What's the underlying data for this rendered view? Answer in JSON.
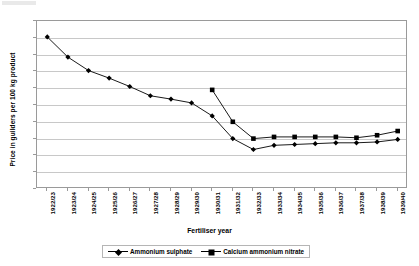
{
  "chart_data": {
    "type": "line",
    "title": "",
    "xlabel": "Fertiliser year",
    "ylabel": "Price in guilders per 100 kg product",
    "ylim": [
      0,
      20
    ],
    "ytick_step": 2,
    "yticks": [
      0,
      2,
      4,
      6,
      8,
      10,
      12,
      14,
      16,
      18,
      20
    ],
    "grid": true,
    "legend_position": "bottom",
    "categories": [
      "1922/23",
      "1923/24",
      "1924/25",
      "1925/26",
      "1926/27",
      "1927/28",
      "1928/29",
      "1929/30",
      "1930/31",
      "1931/32",
      "1932/33",
      "1933/34",
      "1934/35",
      "1935/36",
      "1936/37",
      "1937/38",
      "1938/39",
      "1939/40"
    ],
    "series": [
      {
        "name": "Ammonium sulphate",
        "marker": "diamond",
        "values": [
          18.1,
          15.7,
          14.1,
          13.2,
          12.2,
          11.1,
          10.7,
          10.25,
          8.7,
          6.0,
          4.7,
          5.2,
          5.3,
          5.4,
          5.5,
          5.5,
          5.6,
          5.9
        ]
      },
      {
        "name": "Calcium ammonium nitrate",
        "marker": "square",
        "values": [
          null,
          null,
          null,
          null,
          null,
          null,
          null,
          null,
          11.8,
          8.0,
          6.0,
          6.2,
          6.2,
          6.2,
          6.2,
          6.1,
          6.4,
          6.9
        ]
      }
    ]
  },
  "legend": {
    "items": [
      {
        "label": "Ammonium sulphate"
      },
      {
        "label": "Calcium ammonium nitrate"
      }
    ]
  },
  "axes": {
    "y_title": "Price in guilders per 100 kg product",
    "x_title": "Fertiliser year"
  }
}
